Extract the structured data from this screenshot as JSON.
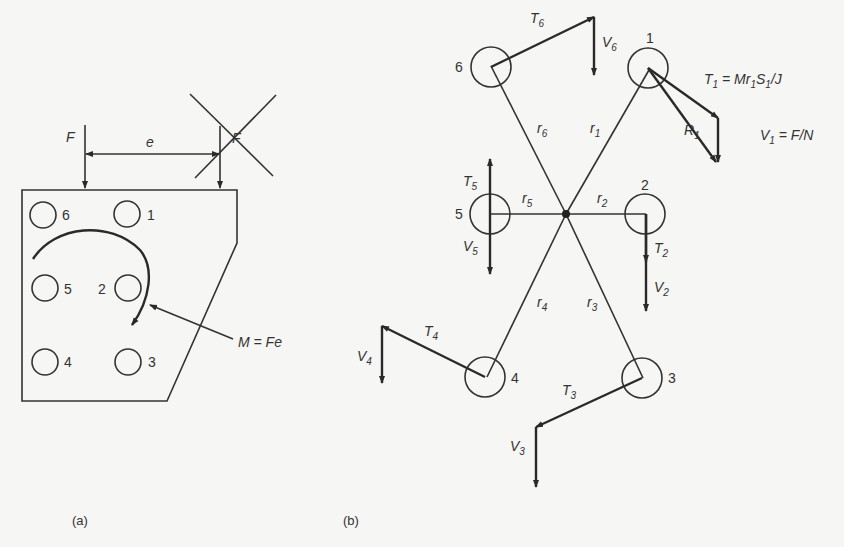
{
  "figure_a": {
    "caption": "(a)",
    "force_label": "F",
    "eccentricity_label": "e",
    "crossed_force_label": "F",
    "moment_label": "M = Fe",
    "bolts": [
      "6",
      "1",
      "5",
      "2",
      "4",
      "3"
    ]
  },
  "figure_b": {
    "caption": "(b)",
    "bolt_labels": [
      "1",
      "2",
      "3",
      "4",
      "5",
      "6"
    ],
    "radius_labels": {
      "r1": "r",
      "r2": "r",
      "r3": "r",
      "r4": "r",
      "r5": "r",
      "r6": "r"
    },
    "radius_subs": {
      "r1": "1",
      "r2": "2",
      "r3": "3",
      "r4": "4",
      "r5": "5",
      "r6": "6"
    },
    "T_label": "T",
    "V_label": "V",
    "R_label": "R",
    "subs": {
      "1": "1",
      "2": "2",
      "3": "3",
      "4": "4",
      "5": "5",
      "6": "6"
    },
    "eq_T1": " = Mr",
    "eq_T1_s": "S",
    "eq_T1_end": "/J",
    "eq_V1": " = F/N"
  },
  "colors": {
    "ink": "#333333",
    "paper": "#f6f6f4"
  }
}
